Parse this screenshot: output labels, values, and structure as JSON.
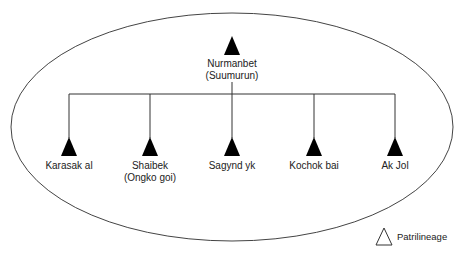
{
  "diagram": {
    "type": "kinship-tree",
    "boundary": "ellipse",
    "root": {
      "name": "Nurmanbet",
      "alias": "(Suumurun)",
      "symbol": "filled-triangle"
    },
    "children": [
      {
        "name": "Karasak al",
        "alias": "",
        "symbol": "filled-triangle"
      },
      {
        "name": "Shaibek",
        "alias": "(Ongko goi)",
        "symbol": "filled-triangle"
      },
      {
        "name": "Sagynd yk",
        "alias": "",
        "symbol": "filled-triangle"
      },
      {
        "name": "Kochok bai",
        "alias": "",
        "symbol": "filled-triangle"
      },
      {
        "name": "Ak Jol",
        "alias": "",
        "symbol": "filled-triangle"
      }
    ],
    "legend": {
      "symbol": "outline-triangle",
      "label": "Patrilineage"
    },
    "colors": {
      "line": "#333333",
      "symbol_fill": "#000000",
      "background": "#ffffff"
    }
  }
}
